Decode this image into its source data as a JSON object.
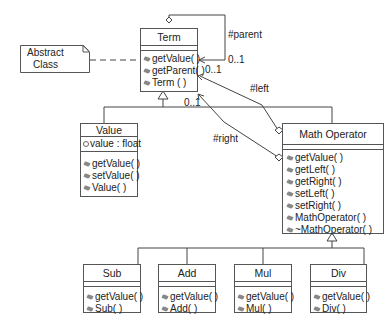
{
  "diagram": {
    "type": "UML class diagram",
    "note": {
      "line1": "Abstract",
      "line2": "Class"
    },
    "classes": {
      "term": {
        "name": "Term",
        "attributes": [],
        "operations": [
          "getValue( )",
          "getParent( )",
          "Term ( )"
        ]
      },
      "value": {
        "name": "Value",
        "attributes": [
          "value : float"
        ],
        "operations": [
          "getValue( )",
          "setValue( )",
          "Value( )"
        ]
      },
      "math_operator": {
        "name": "Math Operator",
        "attributes": [],
        "operations": [
          "getValue( )",
          "getLeft( )",
          "getRight( )",
          "setLeft( )",
          "setRight( )",
          "MathOperator( )",
          "~MathOperator( )"
        ]
      },
      "sub": {
        "name": "Sub",
        "operations": [
          "getValue( )",
          "Sub( )"
        ]
      },
      "add": {
        "name": "Add",
        "operations": [
          "getValue( )",
          "Add( )"
        ]
      },
      "mul": {
        "name": "Mul",
        "operations": [
          "getValue( )",
          "Mul( )"
        ]
      },
      "div": {
        "name": "Div",
        "operations": [
          "getValue( )",
          "Div( )"
        ]
      }
    },
    "associations": {
      "parent": {
        "role": "#parent",
        "multiplicity": "0..1"
      },
      "left": {
        "role": "#left",
        "multiplicity": "0..1"
      },
      "right": {
        "role": "#right",
        "multiplicity": "0..1"
      }
    }
  }
}
